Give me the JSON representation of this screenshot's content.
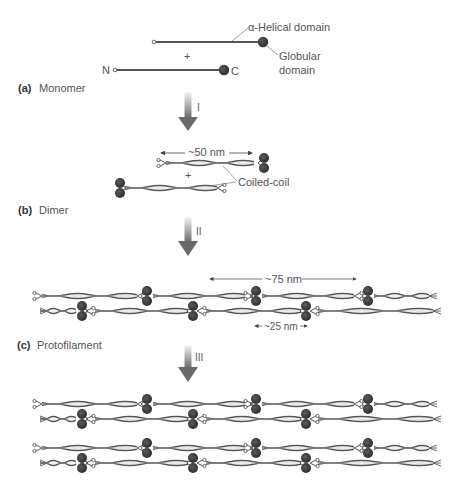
{
  "figure": {
    "panels": [
      {
        "id": "a",
        "letter": "(a)",
        "label": "Monomer"
      },
      {
        "id": "b",
        "letter": "(b)",
        "label": "Dimer"
      },
      {
        "id": "c",
        "letter": "(c)",
        "label": "Protofilament"
      }
    ],
    "monomer": {
      "helical_label": "α-Helical domain",
      "globular_label_line1": "Globular",
      "globular_label_line2": "domain",
      "n_terminus": "N",
      "c_terminus": "C",
      "plus": "+"
    },
    "dimer": {
      "length_label": "~50 nm",
      "coiled_coil_label": "Coiled-coil",
      "plus": "+"
    },
    "protofilament": {
      "repeat_label": "~75 nm",
      "stagger_label": "~25 nm"
    },
    "steps": [
      "I",
      "II",
      "III"
    ],
    "colors": {
      "rod": "#555555",
      "globule": "#3a3a3a",
      "arrow_top": "#f0f0f0",
      "arrow_bottom": "#6e6e6e",
      "text": "#555555"
    }
  }
}
